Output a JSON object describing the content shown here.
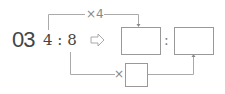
{
  "problem": {
    "number": "03",
    "ratio_left": "4 : 8",
    "arrow": "⇨",
    "top_operator": "×4",
    "bottom_operator": "×",
    "answer_colon": ":",
    "answer_box_1": "",
    "answer_box_2": "",
    "multiplier_box": ""
  },
  "colors": {
    "line": "#aaaaaa",
    "text": "#444444",
    "box_border": "#999999"
  }
}
